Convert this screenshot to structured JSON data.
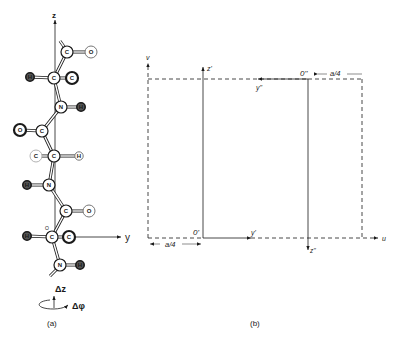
{
  "panel_a": {
    "caption": "(a)",
    "axis_z_label": "z",
    "axis_y_label": "y",
    "delta_z_label": "Δz",
    "delta_phi_label": "Δφ",
    "atoms": [
      {
        "id": "c1",
        "symbol": "C",
        "x": 67,
        "y": 52,
        "style": "normal"
      },
      {
        "id": "o1",
        "symbol": "O",
        "x": 91,
        "y": 52,
        "style": "light"
      },
      {
        "id": "h1",
        "symbol": "H",
        "x": 30,
        "y": 77,
        "style": "dark"
      },
      {
        "id": "c2",
        "symbol": "C",
        "x": 54,
        "y": 78,
        "style": "normal"
      },
      {
        "id": "c3",
        "symbol": "C",
        "x": 72,
        "y": 78,
        "style": "bold"
      },
      {
        "id": "n1",
        "symbol": "N",
        "x": 61,
        "y": 107,
        "style": "normal"
      },
      {
        "id": "h2",
        "symbol": "H",
        "x": 81,
        "y": 107,
        "style": "dark"
      },
      {
        "id": "o2",
        "symbol": "O",
        "x": 20,
        "y": 130,
        "style": "bold"
      },
      {
        "id": "c4",
        "symbol": "C",
        "x": 42,
        "y": 131,
        "style": "normal"
      },
      {
        "id": "c5",
        "symbol": "C",
        "x": 36,
        "y": 156,
        "style": "faint"
      },
      {
        "id": "c6",
        "symbol": "C",
        "x": 54,
        "y": 156,
        "style": "normal"
      },
      {
        "id": "h3",
        "symbol": "H",
        "x": 79,
        "y": 156,
        "style": "light"
      },
      {
        "id": "h4",
        "symbol": "H",
        "x": 27,
        "y": 185,
        "style": "dark"
      },
      {
        "id": "n2",
        "symbol": "N",
        "x": 49,
        "y": 185,
        "style": "normal"
      },
      {
        "id": "c7",
        "symbol": "C",
        "x": 66,
        "y": 211,
        "style": "normal"
      },
      {
        "id": "o3",
        "symbol": "O",
        "x": 89,
        "y": 211,
        "style": "light"
      },
      {
        "id": "h5",
        "symbol": "H",
        "x": 27,
        "y": 236,
        "style": "dark"
      },
      {
        "id": "c8",
        "symbol": "C",
        "x": 52,
        "y": 237,
        "style": "normal"
      },
      {
        "id": "c9",
        "symbol": "C",
        "x": 69,
        "y": 237,
        "style": "bold"
      },
      {
        "id": "n3",
        "symbol": "N",
        "x": 60,
        "y": 265,
        "style": "normal"
      },
      {
        "id": "h6",
        "symbol": "H",
        "x": 80,
        "y": 265,
        "style": "dark"
      }
    ],
    "bonds": [
      [
        "c1",
        "o1"
      ],
      [
        "c1",
        "c2"
      ],
      [
        "h1",
        "c2"
      ],
      [
        "c2",
        "c3"
      ],
      [
        "c2",
        "n1"
      ],
      [
        "n1",
        "h2"
      ],
      [
        "n1",
        "c4"
      ],
      [
        "o2",
        "c4"
      ],
      [
        "c4",
        "c6"
      ],
      [
        "c5",
        "c6"
      ],
      [
        "c6",
        "h3"
      ],
      [
        "c6",
        "n2"
      ],
      [
        "h4",
        "n2"
      ],
      [
        "n2",
        "c7"
      ],
      [
        "c7",
        "o3"
      ],
      [
        "c7",
        "c8"
      ],
      [
        "h5",
        "c8"
      ],
      [
        "c8",
        "c9"
      ],
      [
        "c8",
        "n3"
      ],
      [
        "n3",
        "h6"
      ]
    ],
    "small_o_label": "O"
  },
  "panel_b": {
    "caption": "(b)",
    "axis_v_label": "v",
    "axis_u_label": "u",
    "z_prime_label": "z'",
    "y_prime_label": "y'",
    "o_prime_label": "0'",
    "z_double_prime_label": "z''",
    "y_double_prime_label": "y''",
    "o_double_prime_label": "0''",
    "offset_left_label": "a/4",
    "offset_right_label": "a/4"
  }
}
